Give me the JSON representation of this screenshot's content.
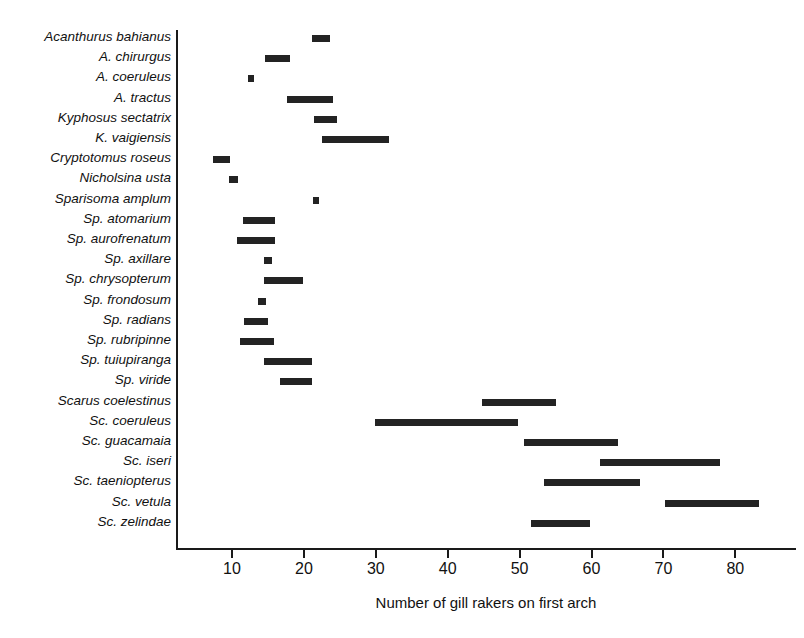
{
  "chart_data": {
    "type": "bar",
    "orientation": "horizontal",
    "subtype": "range-bars",
    "title": "",
    "xlabel": "Number of gill rakers on first arch",
    "ylabel": "",
    "xlim": [
      4,
      90
    ],
    "xticks": [
      10,
      20,
      30,
      40,
      50,
      60,
      70,
      80
    ],
    "xtick_labels": [
      "10",
      "20",
      "30",
      "40",
      "50",
      "60",
      "70",
      "80"
    ],
    "grid": false,
    "legend": null,
    "bar_color": "#232323",
    "axis_color": "#1a1a1a",
    "background": "#ffffff",
    "categories": [
      "Acanthurus bahianus",
      "A. chirurgus",
      "A. coeruleus",
      "A. tractus",
      "Kyphosus sectatrix",
      "K. vaigiensis",
      "Cryptotomus roseus",
      "Nicholsina usta",
      "Sparisoma amplum",
      "Sp. atomarium",
      "Sp. aurofrenatum",
      "Sp. axillare",
      "Sp. chrysopterum",
      "Sp. frondosum",
      "Sp. radians",
      "Sp. rubripinne",
      "Sp. tuiupiranga",
      "Sp. viride",
      "Scarus coelestinus",
      "Sc. coeruleus",
      "Sc. guacamaia",
      "Sc. iseri",
      "Sc. taeniopterus",
      "Sc. vetula",
      "Sc. zelindae"
    ],
    "ranges": [
      {
        "category": "Acanthurus bahianus",
        "min": 21.3,
        "max": 23.8
      },
      {
        "category": "A. chirurgus",
        "min": 14.7,
        "max": 18.2
      },
      {
        "category": "A. coeruleus",
        "min": 12.3,
        "max": 13.0
      },
      {
        "category": "A. tractus",
        "min": 17.8,
        "max": 24.2
      },
      {
        "category": "Kyphosus sectatrix",
        "min": 21.5,
        "max": 24.7
      },
      {
        "category": "K. vaigiensis",
        "min": 22.6,
        "max": 32.0
      },
      {
        "category": "Cryptotomus roseus",
        "min": 7.5,
        "max": 9.9
      },
      {
        "category": "Nicholsina usta",
        "min": 9.7,
        "max": 11.0
      },
      {
        "category": "Sparisoma amplum",
        "min": 21.4,
        "max": 22.1
      },
      {
        "category": "Sp. atomarium",
        "min": 11.7,
        "max": 16.1
      },
      {
        "category": "Sp. aurofrenatum",
        "min": 10.8,
        "max": 16.1
      },
      {
        "category": "Sp. axillare",
        "min": 14.6,
        "max": 15.7
      },
      {
        "category": "Sp. chrysopterum",
        "min": 14.6,
        "max": 20.0
      },
      {
        "category": "Sp. frondosum",
        "min": 13.8,
        "max": 14.9
      },
      {
        "category": "Sp. radians",
        "min": 11.8,
        "max": 15.1
      },
      {
        "category": "Sp. rubripinne",
        "min": 11.3,
        "max": 16.0
      },
      {
        "category": "Sp. tuiupiranga",
        "min": 14.6,
        "max": 21.3
      },
      {
        "category": "Sp. viride",
        "min": 16.8,
        "max": 21.3
      },
      {
        "category": "Scarus coelestinus",
        "min": 44.9,
        "max": 55.2
      },
      {
        "category": "Sc. coeruleus",
        "min": 30.0,
        "max": 49.9
      },
      {
        "category": "Sc. guacamaia",
        "min": 50.8,
        "max": 63.8
      },
      {
        "category": "Sc. iseri",
        "min": 61.3,
        "max": 78.0
      },
      {
        "category": "Sc. taeniopterus",
        "min": 53.5,
        "max": 66.9
      },
      {
        "category": "Sc. vetula",
        "min": 70.3,
        "max": 83.4
      },
      {
        "category": "Sc. zelindae",
        "min": 51.7,
        "max": 59.9
      }
    ]
  },
  "axis": {
    "x_title": "Number of gill rakers on first arch"
  },
  "layout": {
    "plot_left_px": 176,
    "plot_top_px": 30,
    "plot_width_px": 620,
    "plot_height_px": 518,
    "px_per_unit": 7.19,
    "x_at_value_10_px": 231,
    "row_spacing_px": 20.2,
    "first_row_center_px": 38
  }
}
